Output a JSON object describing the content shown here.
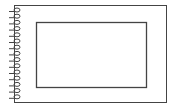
{
  "illustration": {
    "subject": "spiral-notebook",
    "colors": {
      "stroke": "#333333",
      "background": "#ffffff"
    },
    "spiral_ring_count": 15
  }
}
